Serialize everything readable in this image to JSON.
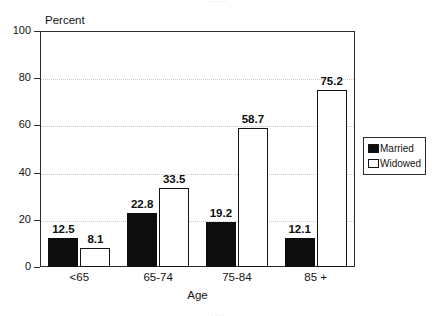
{
  "artifacts": {
    "top_sliver": "·····",
    "bottom_sliver": "····"
  },
  "legend": {
    "position": "right",
    "items": [
      {
        "label": "Married",
        "swatch": "filled-square-icon",
        "color": "#0d0d0d"
      },
      {
        "label": "Widowed",
        "swatch": "hollow-square-icon",
        "color": "#ffffff"
      }
    ]
  },
  "axis": {
    "y_title": "Percent",
    "x_title": "Age",
    "y_ticks": [
      "0",
      "20",
      "40",
      "60",
      "80",
      "100"
    ]
  },
  "chart_data": {
    "type": "bar",
    "title": "",
    "subtitle": "",
    "xlabel": "Age",
    "ylabel": "Percent",
    "ylim": [
      0,
      100
    ],
    "yticks": [
      0,
      20,
      40,
      60,
      80,
      100
    ],
    "grid": true,
    "grid_style": "dotted-horizontal",
    "legend_position": "right",
    "categories": [
      "<65",
      "65-74",
      "75-84",
      "85 +"
    ],
    "series": [
      {
        "name": "Married",
        "color": "#0d0d0d",
        "values": [
          12.5,
          22.8,
          19.2,
          12.1
        ],
        "labels": [
          "12.5",
          "22.8",
          "19.2",
          "12.1"
        ]
      },
      {
        "name": "Widowed",
        "color": "#ffffff",
        "values": [
          8.1,
          33.5,
          58.7,
          75.2
        ],
        "labels": [
          "8.1",
          "33.5",
          "58.7",
          "75.2"
        ]
      }
    ]
  }
}
